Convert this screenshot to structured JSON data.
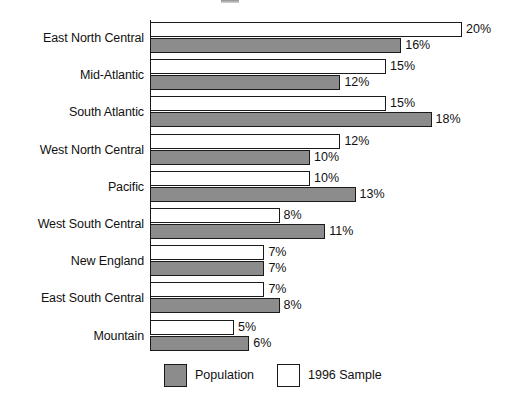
{
  "chart_data": {
    "type": "bar",
    "orientation": "horizontal",
    "title": "",
    "xlabel": "",
    "ylabel": "",
    "grid": false,
    "legend_position": "bottom",
    "value_suffix": "%",
    "xlim": [
      0,
      20
    ],
    "categories": [
      "East North Central",
      "Mid-Atlantic",
      "South Atlantic",
      "West North Central",
      "Pacific",
      "West South Central",
      "New England",
      "East South Central",
      "Mountain"
    ],
    "series": [
      {
        "name": "1996 Sample",
        "color": "#ffffff",
        "values": [
          20,
          15,
          15,
          12,
          10,
          8,
          7,
          7,
          5
        ],
        "labels": [
          "20%",
          "15%",
          "15%",
          "12%",
          "10%",
          "8%",
          "7%",
          "7%",
          "5%"
        ]
      },
      {
        "name": "Population",
        "color": "#8c8c8c",
        "values": [
          16,
          12,
          18,
          10,
          13,
          11,
          7,
          8,
          6
        ],
        "labels": [
          "16%",
          "12%",
          "18%",
          "10%",
          "13%",
          "11%",
          "7%",
          "8%",
          "6%"
        ]
      }
    ]
  },
  "legend": {
    "items": [
      {
        "label": "Population",
        "swatch": "gray-swatch"
      },
      {
        "label": "1996 Sample",
        "swatch": "white-swatch"
      }
    ]
  }
}
